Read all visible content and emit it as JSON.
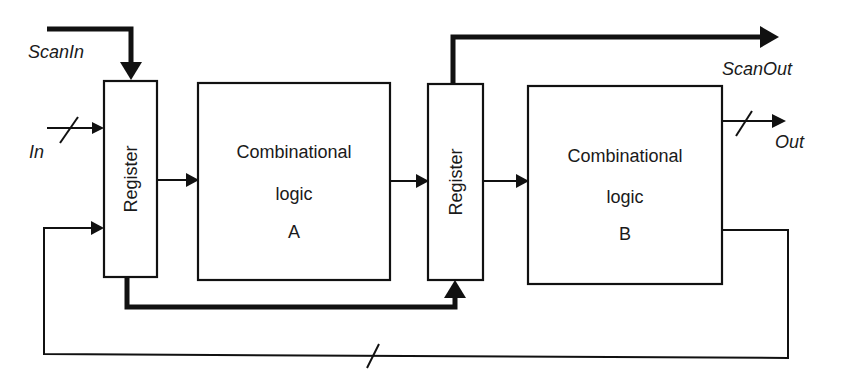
{
  "diagram": {
    "type": "scan-chain pipeline block diagram",
    "colors": {
      "stroke": "#111111",
      "text": "#1a1a1a",
      "background": "#ffffff"
    },
    "signals": {
      "scan_in": "ScanIn",
      "scan_out": "ScanOut",
      "input": "In",
      "output": "Out"
    },
    "blocks": {
      "register_1": {
        "label": "Register"
      },
      "logic_a": {
        "line1": "Combinational",
        "line2": "logic",
        "line3": "A"
      },
      "register_2": {
        "label": "Register"
      },
      "logic_b": {
        "line1": "Combinational",
        "line2": "logic",
        "line3": "B"
      }
    },
    "connections": [
      {
        "from": "ScanIn",
        "to": "Register 1",
        "style": "thick"
      },
      {
        "from": "In",
        "to": "Register 1",
        "style": "bus"
      },
      {
        "from": "Register 1",
        "to": "Combinational logic A",
        "style": "thin"
      },
      {
        "from": "Combinational logic A",
        "to": "Register 2",
        "style": "thin"
      },
      {
        "from": "Register 1",
        "to": "Register 2",
        "style": "thick",
        "note": "scan path"
      },
      {
        "from": "Register 2",
        "to": "ScanOut",
        "style": "thick"
      },
      {
        "from": "Register 2",
        "to": "Combinational logic B",
        "style": "thin"
      },
      {
        "from": "Combinational logic B",
        "to": "Out",
        "style": "bus"
      },
      {
        "from": "Combinational logic B",
        "to": "Register 1",
        "style": "bus",
        "note": "feedback"
      }
    ]
  }
}
